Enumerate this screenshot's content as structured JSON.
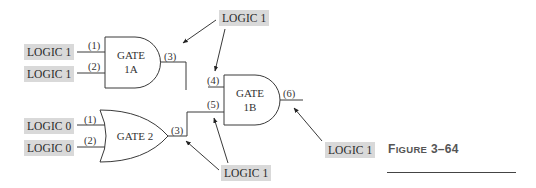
{
  "figure": {
    "caption_prefix": "F",
    "caption_smallcaps": "IGURE",
    "caption_number": "3–64"
  },
  "inputs": {
    "gate1a_in1": "LOGIC 1",
    "gate1a_in2": "LOGIC 1",
    "gate2_in1": "LOGIC 0",
    "gate2_in2": "LOGIC 0"
  },
  "annotations": {
    "top": "LOGIC 1",
    "bottom": "LOGIC 1",
    "right": "LOGIC 1"
  },
  "gates": {
    "gate1a": {
      "type": "AND",
      "line1": "GATE",
      "line2": "1A",
      "pins": [
        "(1)",
        "(2)",
        "(3)"
      ]
    },
    "gate1b": {
      "type": "AND",
      "line1": "GATE",
      "line2": "1B",
      "pins": [
        "(4)",
        "(5)",
        "(6)"
      ]
    },
    "gate2": {
      "type": "OR",
      "line1": "GATE 2",
      "pins": [
        "(1)",
        "(2)",
        "(3)"
      ]
    }
  },
  "colors": {
    "label_bg": "#d9d9d9",
    "stroke": "#3a3a3a"
  }
}
